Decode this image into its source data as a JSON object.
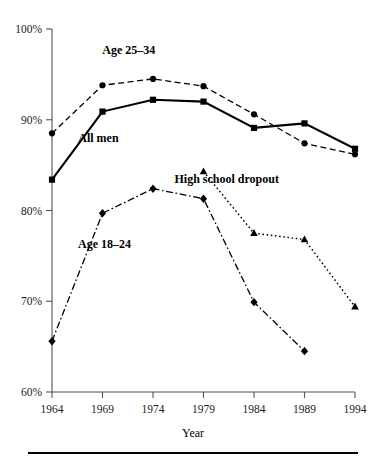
{
  "chart_data": {
    "type": "line",
    "title": "",
    "xlabel": "Year",
    "ylabel": "",
    "x": [
      1964,
      1969,
      1974,
      1979,
      1984,
      1989,
      1994
    ],
    "xtick_labels": [
      "1964",
      "1969",
      "1974",
      "1979",
      "1984",
      "1989",
      "1994"
    ],
    "ytick_labels": [
      "60%",
      "70%",
      "80%",
      "90%",
      "100%"
    ],
    "ytick_values": [
      60,
      70,
      80,
      90,
      100
    ],
    "ylim": [
      60,
      100
    ],
    "xlim": [
      1964,
      1994
    ],
    "grid": false,
    "legend_position": "inline-annotations",
    "series": [
      {
        "name": "Age 25-34",
        "label": "Age 25–34",
        "marker": "circle",
        "dash": "dashed",
        "color": "#000000",
        "label_x": 1971.6,
        "label_y": 97.3,
        "values": [
          88.5,
          93.8,
          94.5,
          93.7,
          90.6,
          87.4,
          86.2
        ]
      },
      {
        "name": "All men",
        "label": "All men",
        "marker": "square",
        "dash": "solid",
        "color": "#000000",
        "label_x": 1968.6,
        "label_y": 87.6,
        "values": [
          83.4,
          90.9,
          92.2,
          92.0,
          89.1,
          89.6,
          86.8
        ]
      },
      {
        "name": "High school dropout",
        "label": "High school dropout",
        "marker": "triangle",
        "dash": "dotted",
        "color": "#000000",
        "label_x": 1981.3,
        "label_y": 83.0,
        "values": [
          null,
          null,
          null,
          84.3,
          77.5,
          76.8,
          69.4
        ]
      },
      {
        "name": "Age 18-24",
        "label": "Age 18–24",
        "marker": "diamond",
        "dash": "dashdot",
        "color": "#000000",
        "label_x": 1969.2,
        "label_y": 75.9,
        "values": [
          65.6,
          79.7,
          82.4,
          81.3,
          69.9,
          64.5,
          null
        ]
      }
    ]
  },
  "figure": {
    "axis_color": "#555555",
    "ink_color": "#000000",
    "background": "#ffffff",
    "rule_label": "bottom-rule"
  }
}
